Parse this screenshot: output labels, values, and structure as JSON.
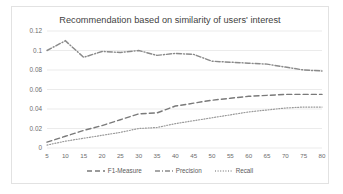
{
  "chart_data": {
    "type": "line",
    "title": "Recommendation based on similarity of users' interest",
    "xlabel": "",
    "ylabel": "",
    "grid": true,
    "legend_position": "bottom",
    "xlim": [
      5,
      80
    ],
    "ylim": [
      0,
      0.12
    ],
    "x": [
      5,
      10,
      15,
      20,
      25,
      30,
      35,
      40,
      45,
      50,
      55,
      60,
      65,
      70,
      75,
      80
    ],
    "xtick_labels": [
      "5",
      "10",
      "15",
      "20",
      "25",
      "30",
      "35",
      "40",
      "45",
      "50",
      "55",
      "60",
      "65",
      "70",
      "75",
      "80"
    ],
    "ytick_labels": [
      "0",
      "0.02",
      "0.04",
      "0.06",
      "0.08",
      "0.1",
      "0.12"
    ],
    "ytick_values": [
      0,
      0.02,
      0.04,
      0.06,
      0.08,
      0.1,
      0.12
    ],
    "series": [
      {
        "name": "F1-Measure",
        "style": "dashed",
        "color": "#7a7a7a",
        "values": [
          0.006,
          0.012,
          0.018,
          0.023,
          0.029,
          0.035,
          0.036,
          0.043,
          0.046,
          0.049,
          0.051,
          0.053,
          0.054,
          0.055,
          0.055,
          0.055
        ]
      },
      {
        "name": "Precision",
        "style": "dash-dot",
        "color": "#8a8a8a",
        "values": [
          0.1,
          0.11,
          0.093,
          0.099,
          0.098,
          0.1,
          0.095,
          0.097,
          0.096,
          0.089,
          0.088,
          0.087,
          0.086,
          0.083,
          0.08,
          0.079
        ]
      },
      {
        "name": "Recall",
        "style": "dotted",
        "color": "#9a9a9a",
        "values": [
          0.003,
          0.007,
          0.01,
          0.013,
          0.016,
          0.02,
          0.021,
          0.025,
          0.028,
          0.031,
          0.034,
          0.037,
          0.039,
          0.041,
          0.042,
          0.042
        ]
      }
    ]
  },
  "legend": {
    "items": [
      {
        "label": "F1-Measure",
        "icon": "dashed-line-swatch-icon"
      },
      {
        "label": "Precision",
        "icon": "dash-dot-line-swatch-icon"
      },
      {
        "label": "Recall",
        "icon": "dotted-line-swatch-icon"
      }
    ]
  },
  "colors": {
    "frame_border": "#e2e2e2",
    "gridline": "#e6e6e6",
    "axis_text": "#6d6d6d",
    "title_text": "#3f3f3f",
    "background": "#ffffff"
  }
}
